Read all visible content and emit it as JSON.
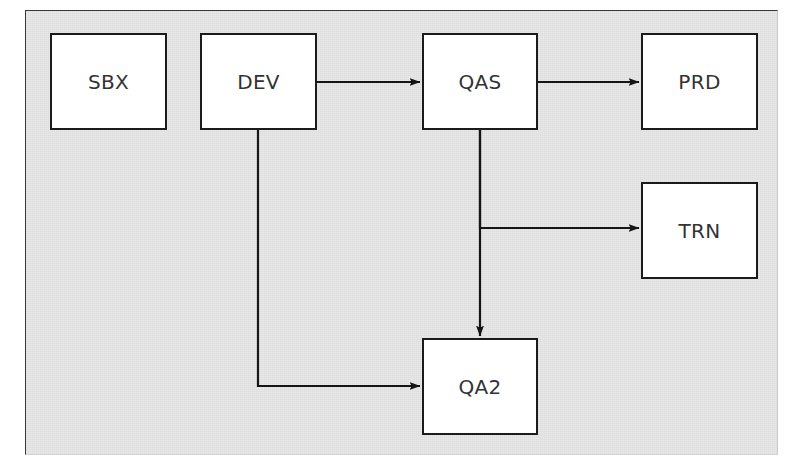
{
  "diagram": {
    "type": "flowchart",
    "background_color": "#e7e7e7",
    "node_fill_color": "#ffffff",
    "node_border_color": "#1b1b1b",
    "text_color": "#333333",
    "nodes": [
      {
        "id": "sbx",
        "label": "SBX",
        "x": 50,
        "y": 33,
        "width": 117,
        "height": 97
      },
      {
        "id": "dev",
        "label": "DEV",
        "x": 200,
        "y": 33,
        "width": 117,
        "height": 97
      },
      {
        "id": "qas",
        "label": "QAS",
        "x": 422,
        "y": 33,
        "width": 116,
        "height": 97
      },
      {
        "id": "prd",
        "label": "PRD",
        "x": 641,
        "y": 33,
        "width": 117,
        "height": 97
      },
      {
        "id": "trn",
        "label": "TRN",
        "x": 641,
        "y": 182,
        "width": 117,
        "height": 97
      },
      {
        "id": "qa2",
        "label": "QA2",
        "x": 422,
        "y": 338,
        "width": 116,
        "height": 97
      }
    ],
    "edges": [
      {
        "id": "dev-qas",
        "from": "DEV",
        "to": "QAS",
        "style": "straight-horizontal",
        "arrow": "end"
      },
      {
        "id": "qas-prd",
        "from": "QAS",
        "to": "PRD",
        "style": "straight-horizontal",
        "arrow": "end"
      },
      {
        "id": "qas-trn",
        "from": "QAS",
        "to": "TRN",
        "style": "elbow-down-right",
        "arrow": "end"
      },
      {
        "id": "qas-qa2",
        "from": "QAS",
        "to": "QA2",
        "style": "straight-vertical",
        "arrow": "end"
      },
      {
        "id": "dev-qa2",
        "from": "DEV",
        "to": "QA2",
        "style": "elbow-down-right",
        "arrow": "end"
      }
    ]
  }
}
